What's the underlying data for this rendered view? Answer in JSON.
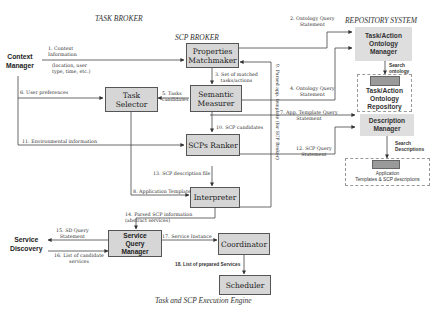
{
  "regions": {
    "task_broker": "TASK BROKER",
    "scp_broker": "SCP BROKER",
    "repository_system": "REPOSITORY SYSTEM",
    "execution_engine": "Task and SCP Execution Engine"
  },
  "actors": {
    "context_manager": "Context\nManager",
    "service_discovery": "Service\nDiscovery"
  },
  "components": {
    "properties_matchmaker": "Properties\nMatchmaker",
    "task_selector": "Task\nSelector",
    "semantic_measurer": "Semantic\nMeasurer",
    "scps_ranker": "SCPs Ranker",
    "interpreter": "Interpreter",
    "service_query_manager": "Service\nQuery\nManager",
    "coordinator": "Coordinator",
    "scheduler": "Scheduler"
  },
  "repository": {
    "ontology_manager": "Task/Action\nOntology\nManager",
    "ontology_repository": "Task/Action\nOntology\nRepository",
    "description_manager": "Description\nManager",
    "templates_store": "Application\nTemplates & SCP descriptions",
    "search_ontology": "Search\nontology",
    "search_descriptions": "Search\nDescriptions"
  },
  "flows": {
    "f1": "1. Context\nInformation",
    "f1_detail": "(location, user\ntype, time, etc.)",
    "f2": "2. Ontology Query\nStatement",
    "f3": "3. Set of matched\ntasks/actions",
    "f4": "4. Ontology Query\nStatement",
    "f5": "5. Tasks\ncandidates",
    "f6": "6. User preferences",
    "f7": "7. App. Template Query\nStatement",
    "f8": "8. Application Template",
    "f9": "9. Parsed app. template (for SCP\nBroker)",
    "f10": "10. SCP candidates",
    "f11": "11. Environmental information",
    "f12": "12. SCP Query\nStatement",
    "f13": "13. SCP description file",
    "f14": "14. Parsed SCP information\n(abstract services)",
    "f15": "15. SD Query\nStatement",
    "f16": "16. List of candidate\nservices",
    "f17": "17. Service Instance",
    "f18": "18. List of prepared Services"
  }
}
